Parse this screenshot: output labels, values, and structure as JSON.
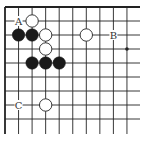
{
  "diagram": {
    "type": "go-board-fragment",
    "corner": "top-left",
    "columns": 10,
    "rows": 10,
    "colors": {
      "line": "#222222",
      "black_stone": "#1a1a1a",
      "white_stone_fill": "#ffffff",
      "white_stone_stroke": "#222222",
      "label": "#333333",
      "background": "#ffffff"
    },
    "stones": [
      {
        "color": "white",
        "col": 2,
        "row": 1
      },
      {
        "color": "black",
        "col": 1,
        "row": 2
      },
      {
        "color": "black",
        "col": 2,
        "row": 2
      },
      {
        "color": "white",
        "col": 3,
        "row": 2
      },
      {
        "color": "white",
        "col": 6,
        "row": 2
      },
      {
        "color": "white",
        "col": 3,
        "row": 3
      },
      {
        "color": "black",
        "col": 2,
        "row": 4
      },
      {
        "color": "black",
        "col": 3,
        "row": 4
      },
      {
        "color": "black",
        "col": 4,
        "row": 4
      },
      {
        "color": "white",
        "col": 3,
        "row": 7
      }
    ],
    "labels": [
      {
        "text": "A",
        "col": 1,
        "row": 1
      },
      {
        "text": "B",
        "col": 8,
        "row": 2
      },
      {
        "text": "C",
        "col": 1,
        "row": 7
      }
    ],
    "star_points": [
      {
        "col": 9,
        "row": 3
      }
    ]
  }
}
